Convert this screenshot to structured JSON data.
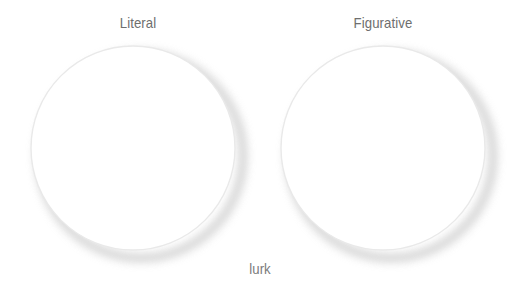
{
  "canvas": {
    "width": 520,
    "height": 300,
    "background": "#ffffff"
  },
  "diagram": {
    "type": "venn-two-set",
    "title": "",
    "sets": [
      {
        "id": "left",
        "label": "Literal",
        "label_x": 138,
        "label_y": 22,
        "cx": 133,
        "cy": 148,
        "r": 102,
        "stroke": "#e9e9e9",
        "fill": "#ffffff",
        "shadow": "#d8d8d8"
      },
      {
        "id": "right",
        "label": "Figurative",
        "label_x": 383,
        "label_y": 22,
        "cx": 383,
        "cy": 148,
        "r": 102,
        "stroke": "#e9e9e9",
        "fill": "#ffffff",
        "shadow": "#d8d8d8"
      }
    ],
    "intersection": {
      "label": "lurk",
      "label_x": 260,
      "label_y": 268
    }
  },
  "colors": {
    "background": "#ffffff",
    "circle_stroke": "#e9e9e9",
    "circle_shadow": "#d6d6d6",
    "set_label_text": "#6e6e6e",
    "intersection_label_text": "#7b7b7b"
  }
}
